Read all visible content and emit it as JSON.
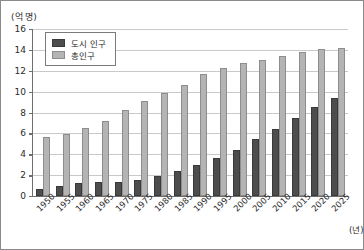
{
  "chart_data": {
    "type": "bar",
    "title": "",
    "xlabel": "(년)",
    "ylabel": "(억 명)",
    "ylim": [
      0,
      16
    ],
    "ytick_step": 2,
    "yticks": [
      0,
      2,
      4,
      6,
      8,
      10,
      12,
      14,
      16
    ],
    "grid": true,
    "legend_position": "top-left",
    "categories": [
      "1950",
      "1955",
      "1960",
      "1965",
      "1970",
      "1975",
      "1980",
      "1985",
      "1990",
      "1995",
      "2000",
      "2005",
      "2010",
      "2015",
      "2020",
      "2025"
    ],
    "series": [
      {
        "name": "도시 인구",
        "color": "#4d4d4d",
        "values": [
          0.7,
          0.95,
          1.2,
          1.3,
          1.35,
          1.55,
          1.9,
          2.4,
          3.0,
          3.65,
          4.45,
          5.45,
          6.4,
          7.45,
          8.55,
          9.35
        ]
      },
      {
        "name": "총인구",
        "color": "#b4b4b4",
        "values": [
          5.65,
          5.95,
          6.5,
          7.15,
          8.2,
          9.15,
          9.9,
          10.65,
          11.65,
          12.25,
          12.7,
          13.05,
          13.45,
          13.8,
          14.1,
          14.2
        ]
      }
    ]
  },
  "legend": {
    "items": [
      {
        "label": "도시 인구"
      },
      {
        "label": "총인구"
      }
    ]
  },
  "axes": {
    "y_unit_caption": "(억 명)",
    "x_unit_caption": "(년)"
  }
}
